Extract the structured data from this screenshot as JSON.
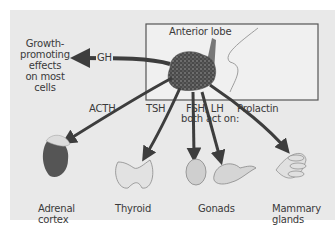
{
  "diagram": {
    "title_region": "Anterior pituitary hormones and targets",
    "lobe_label": "Anterior lobe",
    "effect_label": "Growth-promoting effects on most cells",
    "effect_lines": [
      "Growth-",
      "promoting",
      "effects",
      "on most",
      "cells"
    ],
    "hormones": {
      "gh": "GH",
      "acth": "ACTH",
      "tsh": "TSH",
      "fsh_lh": "FSH, LH",
      "fsh_lh_note": "both act on:",
      "prolactin": "Prolactin"
    },
    "targets": {
      "adrenal": [
        "Adrenal",
        "cortex"
      ],
      "thyroid": "Thyroid",
      "gonads": "Gonads",
      "mammary": [
        "Mammary",
        "glands"
      ]
    },
    "colors": {
      "background": "#e9e9e9",
      "arrow": "#3d3d3d",
      "box_border": "#555555",
      "box_fill": "#f0f0f0",
      "gland": "#4a4a4a",
      "text": "#3a3a3a"
    }
  }
}
